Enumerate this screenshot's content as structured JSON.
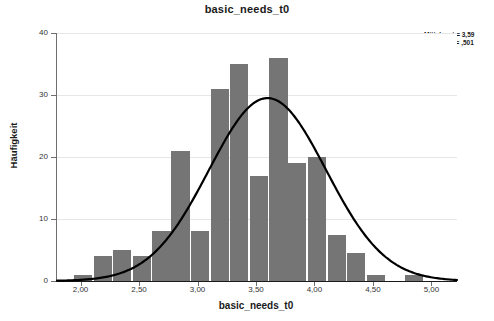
{
  "chart_data": {
    "type": "bar",
    "title": "basic_needs_t0",
    "xlabel": "basic_needs_t0",
    "ylabel": "Häufigkeit",
    "grid": true,
    "legend_position": "top-right",
    "xlim": [
      1.79,
      5.21
    ],
    "ylim": [
      0,
      40
    ],
    "bin_width": 0.167,
    "xticks": [
      "2,00",
      "2,50",
      "3,00",
      "3,50",
      "4,00",
      "4,50",
      "5,00"
    ],
    "xtick_values": [
      2.0,
      2.5,
      3.0,
      3.5,
      4.0,
      4.5,
      5.0
    ],
    "yticks": [
      "0",
      "10",
      "20",
      "30",
      "40"
    ],
    "ytick_values": [
      0,
      10,
      20,
      30,
      40
    ],
    "bins": [
      {
        "center": 2.02,
        "value": 1
      },
      {
        "center": 2.19,
        "value": 4
      },
      {
        "center": 2.35,
        "value": 5
      },
      {
        "center": 2.52,
        "value": 4
      },
      {
        "center": 2.69,
        "value": 8
      },
      {
        "center": 2.85,
        "value": 21
      },
      {
        "center": 3.02,
        "value": 8
      },
      {
        "center": 3.19,
        "value": 31
      },
      {
        "center": 3.35,
        "value": 35
      },
      {
        "center": 3.52,
        "value": 17
      },
      {
        "center": 3.69,
        "value": 36
      },
      {
        "center": 3.85,
        "value": 19
      },
      {
        "center": 4.02,
        "value": 20
      },
      {
        "center": 4.19,
        "value": 7.5
      },
      {
        "center": 4.35,
        "value": 4.5
      },
      {
        "center": 4.52,
        "value": 1
      },
      {
        "center": 4.85,
        "value": 1
      }
    ],
    "normal_curve": {
      "mean": 3.59,
      "std": 0.501,
      "n": 224,
      "peak_value": 29.5
    },
    "annotations": {
      "mean_label": "Mittelwert = 3,59",
      "std_label": "Std.-Abw. = ,501",
      "n_label": "N = 224"
    }
  }
}
